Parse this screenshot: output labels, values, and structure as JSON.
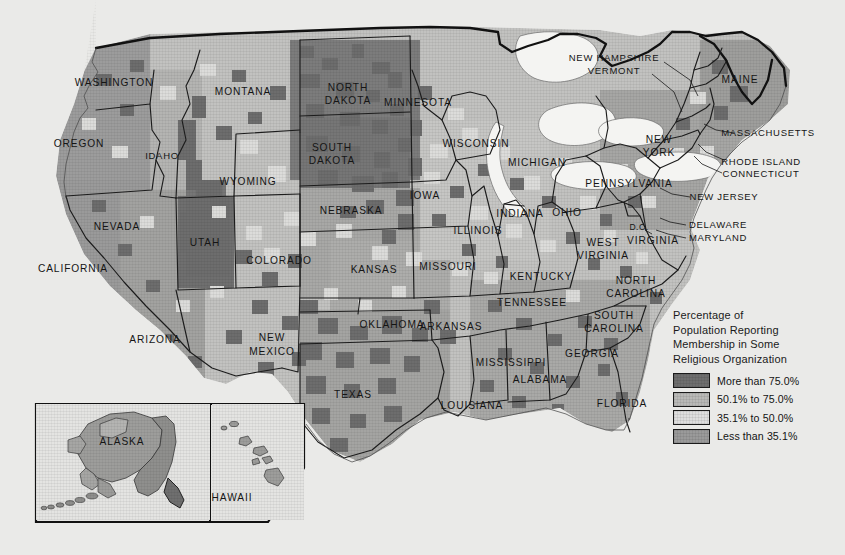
{
  "document": {
    "type": "choropleth-map",
    "subject": "United States religious membership by county",
    "background_color": "#e9e9e7"
  },
  "legend": {
    "title_lines": [
      "Percentage of",
      "Population Reporting",
      "Membership in Some",
      "Religious Organization"
    ],
    "items": [
      {
        "label": "More than 75.0%",
        "color": "#6e6e6e"
      },
      {
        "label": "50.1% to 75.0%",
        "color": "#b9b9b7"
      },
      {
        "label": "35.1% to 50.0%",
        "color": "#dedede"
      },
      {
        "label": "Less than 35.1%",
        "color": "#9a9a9a"
      }
    ]
  },
  "map": {
    "state_labels": [
      {
        "name": "WASHINGTON",
        "x": 114,
        "y": 83,
        "size": "lg"
      },
      {
        "name": "OREGON",
        "x": 79,
        "y": 144,
        "size": "lg"
      },
      {
        "name": "IDAHO",
        "x": 162,
        "y": 156,
        "size": "md"
      },
      {
        "name": "MONTANA",
        "x": 243,
        "y": 92,
        "size": "lg"
      },
      {
        "name": "WYOMING",
        "x": 248,
        "y": 182,
        "size": "lg"
      },
      {
        "name": "NEVADA",
        "x": 117,
        "y": 227,
        "size": "lg"
      },
      {
        "name": "UTAH",
        "x": 205,
        "y": 243,
        "size": "lg"
      },
      {
        "name": "CALIFORNIA",
        "x": 73,
        "y": 269,
        "size": "lg"
      },
      {
        "name": "ARIZONA",
        "x": 155,
        "y": 340,
        "size": "lg"
      },
      {
        "name": "COLORADO",
        "x": 279,
        "y": 261,
        "size": "lg"
      },
      {
        "name": "NEW",
        "x": 272,
        "y": 338,
        "size": "lg"
      },
      {
        "name": "MEXICO",
        "x": 272,
        "y": 352,
        "size": "lg"
      },
      {
        "name": "NORTH",
        "x": 348,
        "y": 88,
        "size": "lg"
      },
      {
        "name": "DAKOTA",
        "x": 348,
        "y": 101,
        "size": "lg"
      },
      {
        "name": "SOUTH",
        "x": 332,
        "y": 148,
        "size": "lg"
      },
      {
        "name": "DAKOTA",
        "x": 332,
        "y": 161,
        "size": "lg"
      },
      {
        "name": "NEBRASKA",
        "x": 351,
        "y": 211,
        "size": "lg"
      },
      {
        "name": "KANSAS",
        "x": 374,
        "y": 270,
        "size": "lg"
      },
      {
        "name": "OKLAHOMA",
        "x": 392,
        "y": 325,
        "size": "lg"
      },
      {
        "name": "TEXAS",
        "x": 353,
        "y": 395,
        "size": "lg"
      },
      {
        "name": "MINNESOTA",
        "x": 418,
        "y": 103,
        "size": "lg"
      },
      {
        "name": "IOWA",
        "x": 425,
        "y": 196,
        "size": "lg"
      },
      {
        "name": "MISSOURI",
        "x": 448,
        "y": 267,
        "size": "lg"
      },
      {
        "name": "ARKANSAS",
        "x": 451,
        "y": 327,
        "size": "lg"
      },
      {
        "name": "LOUISIANA",
        "x": 472,
        "y": 406,
        "size": "lg"
      },
      {
        "name": "WISCONSIN",
        "x": 476,
        "y": 144,
        "size": "lg"
      },
      {
        "name": "ILLINOIS",
        "x": 478,
        "y": 231,
        "size": "lg"
      },
      {
        "name": "MICHIGAN",
        "x": 537,
        "y": 163,
        "size": "lg"
      },
      {
        "name": "INDIANA",
        "x": 520,
        "y": 214,
        "size": "lg"
      },
      {
        "name": "OHIO",
        "x": 567,
        "y": 213,
        "size": "lg"
      },
      {
        "name": "KENTUCKY",
        "x": 541,
        "y": 277,
        "size": "lg"
      },
      {
        "name": "TENNESSEE",
        "x": 532,
        "y": 303,
        "size": "lg"
      },
      {
        "name": "MISSISSIPPI",
        "x": 511,
        "y": 363,
        "size": "lg"
      },
      {
        "name": "ALABAMA",
        "x": 540,
        "y": 380,
        "size": "lg"
      },
      {
        "name": "GEORGIA",
        "x": 592,
        "y": 354,
        "size": "lg"
      },
      {
        "name": "FLORIDA",
        "x": 622,
        "y": 404,
        "size": "lg"
      },
      {
        "name": "SOUTH",
        "x": 614,
        "y": 316,
        "size": "lg"
      },
      {
        "name": "CAROLINA",
        "x": 614,
        "y": 329,
        "size": "lg"
      },
      {
        "name": "NORTH",
        "x": 636,
        "y": 281,
        "size": "lg"
      },
      {
        "name": "CAROLINA",
        "x": 636,
        "y": 294,
        "size": "lg"
      },
      {
        "name": "WEST",
        "x": 603,
        "y": 243,
        "size": "lg"
      },
      {
        "name": "VIRGINIA",
        "x": 603,
        "y": 256,
        "size": "lg"
      },
      {
        "name": "VIRGINIA",
        "x": 653,
        "y": 241,
        "size": "lg"
      },
      {
        "name": "D.C.",
        "x": 639,
        "y": 228,
        "size": "sm"
      },
      {
        "name": "PENNSYLVANIA",
        "x": 629,
        "y": 184,
        "size": "lg"
      },
      {
        "name": "NEW",
        "x": 659,
        "y": 140,
        "size": "lg"
      },
      {
        "name": "YORK",
        "x": 659,
        "y": 153,
        "size": "lg"
      },
      {
        "name": "MAINE",
        "x": 740,
        "y": 80,
        "size": "lg"
      }
    ],
    "callout_labels": [
      {
        "name": "NEW HAMPSHIRE",
        "x": 614,
        "y": 58,
        "anchor": "middle"
      },
      {
        "name": "VERMONT",
        "x": 614,
        "y": 71,
        "anchor": "middle"
      },
      {
        "name": "MASSACHUSETTS",
        "x": 768,
        "y": 133,
        "anchor": "middle"
      },
      {
        "name": "RHODE ISLAND",
        "x": 761,
        "y": 162,
        "anchor": "middle"
      },
      {
        "name": "CONNECTICUT",
        "x": 761,
        "y": 174,
        "anchor": "middle"
      },
      {
        "name": "NEW JERSEY",
        "x": 724,
        "y": 197,
        "anchor": "middle"
      },
      {
        "name": "DELAWARE",
        "x": 718,
        "y": 225,
        "anchor": "middle"
      },
      {
        "name": "MARYLAND",
        "x": 718,
        "y": 238,
        "anchor": "middle"
      }
    ],
    "inset_labels": [
      {
        "name": "ALASKA",
        "x": 122,
        "y": 442
      },
      {
        "name": "HAWAII",
        "x": 232,
        "y": 498
      }
    ]
  }
}
